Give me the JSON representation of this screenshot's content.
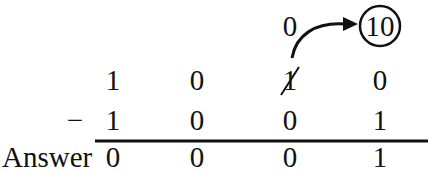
{
  "diagram": {
    "type": "binary-subtraction-with-borrow",
    "borrow_row": {
      "new_value": "0",
      "borrowed_value": "10"
    },
    "minuend": [
      "1",
      "0",
      "1",
      "0"
    ],
    "minuend_struck_index": 2,
    "operator": "−",
    "subtrahend": [
      "1",
      "0",
      "0",
      "1"
    ],
    "answer_label": "Answer",
    "answer": [
      "0",
      "0",
      "0",
      "1"
    ]
  }
}
